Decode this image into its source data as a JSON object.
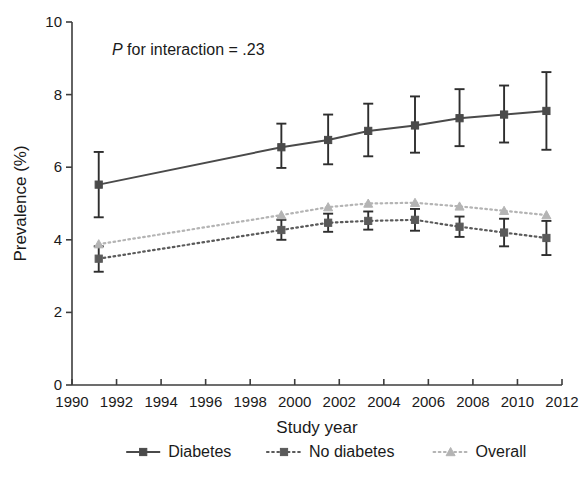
{
  "figure": {
    "annotation_prefix": "P",
    "annotation_rest": " for interaction = .23"
  },
  "chart_data": {
    "type": "line",
    "title": "",
    "subtitle": "",
    "xlabel": "Study year",
    "ylabel": "Prevalence (%)",
    "xlim": [
      1990,
      2012
    ],
    "ylim": [
      0,
      10
    ],
    "xticks": [
      1990,
      1992,
      1994,
      1996,
      1998,
      2000,
      2002,
      2004,
      2006,
      2008,
      2010,
      2012
    ],
    "yticks": [
      0,
      2,
      4,
      6,
      8,
      10
    ],
    "xtick_labels": [
      "1990",
      "1992",
      "1994",
      "1996",
      "1998",
      "2000",
      "2002",
      "2004",
      "2006",
      "2008",
      "2010",
      "2012"
    ],
    "ytick_labels": [
      "0",
      "2",
      "4",
      "6",
      "8",
      "10"
    ],
    "grid": false,
    "legend_position": "below",
    "error_bars": "95% CI",
    "annotations": [
      {
        "text": "P for interaction = .23",
        "x": 1991.6,
        "y": 9.3,
        "italic_prefix": "P"
      }
    ],
    "series": [
      {
        "name": "Diabetes",
        "color": "#4a4a4a",
        "linestyle": "solid",
        "marker": "square",
        "x": [
          1991.2,
          1999.4,
          2001.5,
          2003.3,
          2005.4,
          2007.4,
          2009.4,
          2011.3
        ],
        "values": [
          5.52,
          6.55,
          6.75,
          7.0,
          7.15,
          7.35,
          7.45,
          7.55
        ],
        "err_low": [
          4.62,
          5.98,
          6.08,
          6.3,
          6.4,
          6.58,
          6.68,
          6.48
        ],
        "err_high": [
          6.42,
          7.2,
          7.45,
          7.75,
          7.95,
          8.15,
          8.25,
          8.62
        ]
      },
      {
        "name": "No diabetes",
        "color": "#5a5a5a",
        "linestyle": "dotted",
        "marker": "square",
        "x": [
          1991.2,
          1999.4,
          2001.5,
          2003.3,
          2005.4,
          2007.4,
          2009.4,
          2011.3
        ],
        "values": [
          3.48,
          4.27,
          4.47,
          4.52,
          4.55,
          4.36,
          4.2,
          4.05
        ],
        "err_low": [
          3.12,
          4.0,
          4.22,
          4.28,
          4.25,
          4.08,
          3.82,
          3.58
        ],
        "err_high": [
          3.82,
          4.55,
          4.72,
          4.78,
          4.85,
          4.64,
          4.58,
          4.52
        ]
      },
      {
        "name": "Overall",
        "color": "#b4b4b4",
        "linestyle": "dotted",
        "marker": "triangle",
        "x": [
          1991.2,
          1999.4,
          2001.5,
          2003.3,
          2005.4,
          2007.4,
          2009.4,
          2011.3
        ],
        "values": [
          3.88,
          4.68,
          4.9,
          5.0,
          5.02,
          4.92,
          4.8,
          4.68
        ],
        "err_low": [
          3.88,
          4.68,
          4.9,
          5.0,
          5.02,
          4.92,
          4.8,
          4.68
        ],
        "err_high": [
          3.88,
          4.68,
          4.9,
          5.0,
          5.02,
          4.92,
          4.8,
          4.68
        ]
      }
    ],
    "legend": [
      {
        "label": "Diabetes",
        "color": "#4a4a4a",
        "linestyle": "solid",
        "marker": "square"
      },
      {
        "label": "No diabetes",
        "color": "#5a5a5a",
        "linestyle": "dotted",
        "marker": "square"
      },
      {
        "label": "Overall",
        "color": "#b4b4b4",
        "linestyle": "dotted",
        "marker": "triangle"
      }
    ]
  }
}
